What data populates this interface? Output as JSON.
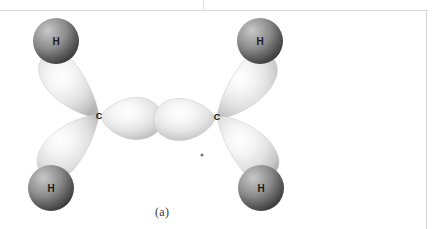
{
  "figure": {
    "caption": "(a)",
    "molecule": "ethane-type sigma framework",
    "colors": {
      "background": "#ffffff",
      "sphere_light": "#b9b9b9",
      "sphere_mid": "#8d8d8d",
      "sphere_dark": "#434343",
      "lobe_light": "#fbfbfb",
      "lobe_mid": "#dedede",
      "lobe_dark": "#b0b0b0",
      "label_text": "#1a1a1a",
      "rule": "#d8d8d8"
    }
  },
  "atoms": {
    "carbons": [
      {
        "label": "C",
        "id": "carbon-left",
        "x": 99,
        "y": 116
      },
      {
        "label": "C",
        "id": "carbon-right",
        "x": 217,
        "y": 117
      }
    ],
    "hydrogens": [
      {
        "label": "H",
        "id": "hydrogen-top-left",
        "x": 56,
        "y": 41,
        "r": 23
      },
      {
        "label": "H",
        "id": "hydrogen-top-right",
        "x": 260,
        "y": 41,
        "r": 23
      },
      {
        "label": "H",
        "id": "hydrogen-bottom-left",
        "x": 51,
        "y": 188,
        "r": 23
      },
      {
        "label": "H",
        "id": "hydrogen-bottom-right",
        "x": 261,
        "y": 188,
        "r": 23
      }
    ]
  },
  "bonds": {
    "central_sigma": {
      "name": "C-C sigma bond",
      "from": "carbon-left",
      "to": "carbon-right"
    },
    "ch_bonds": [
      {
        "name": "C-H bond top left",
        "from": "carbon-left",
        "to": "hydrogen-top-left"
      },
      {
        "name": "C-H bond bottom left",
        "from": "carbon-left",
        "to": "hydrogen-bottom-left"
      },
      {
        "name": "C-H bond top right",
        "from": "carbon-right",
        "to": "hydrogen-top-right"
      },
      {
        "name": "C-H bond bottom right",
        "from": "carbon-right",
        "to": "hydrogen-bottom-right"
      }
    ]
  },
  "artifacts": {
    "speck": {
      "name": "scan-speck",
      "x": 202,
      "y": 155,
      "r": 1.6
    }
  }
}
